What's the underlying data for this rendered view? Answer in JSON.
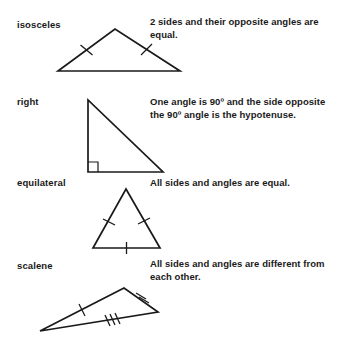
{
  "page": {
    "background_color": "#ffffff",
    "ink_color": "#1a1a1a"
  },
  "entries": [
    {
      "label": "isosceles",
      "description": "2 sides and their opposite angles are equal.",
      "figure": "isosceles-triangle",
      "equal_side_marks": 2,
      "has_right_angle_marker": false
    },
    {
      "label": "right",
      "description": "One angle is 90º and the side opposite the 90º angle is the hypotenuse.",
      "figure": "right-triangle",
      "equal_side_marks": 0,
      "has_right_angle_marker": true
    },
    {
      "label": "equilateral",
      "description": "All sides and angles are equal.",
      "figure": "equilateral-triangle",
      "equal_side_marks": 3,
      "has_right_angle_marker": false
    },
    {
      "label": "scalene",
      "description": "All sides and angles are different from each other.",
      "figure": "scalene-triangle",
      "equal_side_marks": 0,
      "has_right_angle_marker": false
    }
  ]
}
